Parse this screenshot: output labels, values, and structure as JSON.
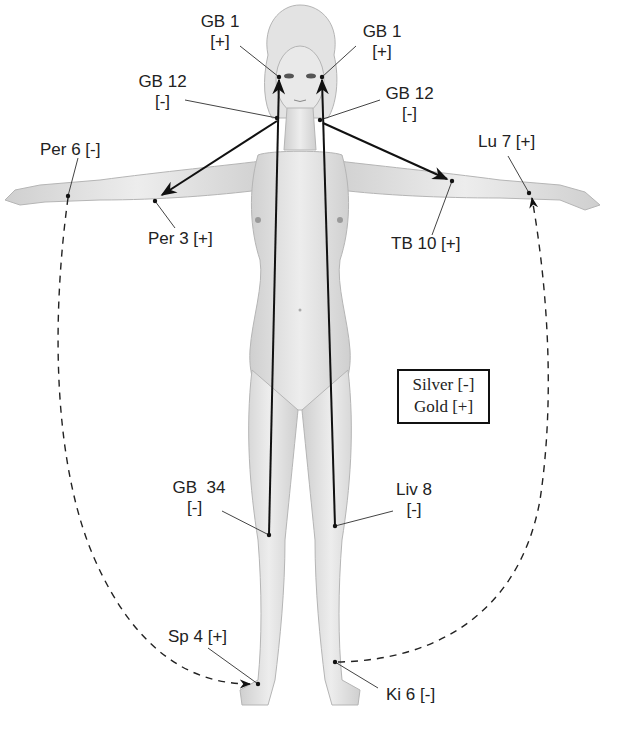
{
  "diagram": {
    "points": [
      {
        "id": "gb1-right",
        "name": "GB 1",
        "polarity": "[+]",
        "x": 279,
        "y": 77
      },
      {
        "id": "gb1-left",
        "name": "GB 1",
        "polarity": "[+]",
        "x": 322,
        "y": 77
      },
      {
        "id": "gb12-right",
        "name": "GB 12",
        "polarity": "[-]",
        "x": 277,
        "y": 118
      },
      {
        "id": "gb12-left",
        "name": "GB 12",
        "polarity": "[-]",
        "x": 320,
        "y": 120
      },
      {
        "id": "per6",
        "name": "Per 6",
        "polarity": "[-]",
        "x": 68,
        "y": 196
      },
      {
        "id": "per3",
        "name": "Per 3",
        "polarity": "[+]",
        "x": 155,
        "y": 201
      },
      {
        "id": "tb10",
        "name": "TB 10",
        "polarity": "[+]",
        "x": 452,
        "y": 181
      },
      {
        "id": "lu7",
        "name": "Lu 7",
        "polarity": "[+]",
        "x": 529,
        "y": 193
      },
      {
        "id": "gb34",
        "name": "GB 34",
        "polarity": "[-]",
        "x": 269,
        "y": 535
      },
      {
        "id": "liv8",
        "name": "Liv 8",
        "polarity": "[-]",
        "x": 335,
        "y": 526
      },
      {
        "id": "sp4",
        "name": "Sp 4",
        "polarity": "[+]",
        "x": 258,
        "y": 684
      },
      {
        "id": "ki6",
        "name": "Ki 6",
        "polarity": "[-]",
        "x": 335,
        "y": 662
      }
    ],
    "labels": {
      "gb1_right_name": "GB 1",
      "gb1_right_pol": "[+]",
      "gb1_left_name": "GB 1",
      "gb1_left_pol": "[+]",
      "gb12_right_name": "GB 12",
      "gb12_right_pol": "[-]",
      "gb12_left_name": "GB 12",
      "gb12_left_pol": "[-]",
      "per6": "Per 6 [-]",
      "per3": "Per 3 [+]",
      "lu7": "Lu 7 [+]",
      "tb10": "TB 10 [+]",
      "gb34_name": "GB  34",
      "gb34_pol": "[-]",
      "liv8_name": "Liv 8",
      "liv8_pol": "[-]",
      "sp4": "Sp 4 [+]",
      "ki6": "Ki 6 [-]"
    },
    "legend": {
      "line1": "Silver [-]",
      "line2": "Gold [+]"
    },
    "connections": [
      {
        "from": "gb34",
        "to": "gb1-right",
        "style": "solid-arrow"
      },
      {
        "from": "liv8",
        "to": "gb1-left",
        "style": "solid-arrow"
      },
      {
        "from": "gb12-right",
        "to": "per3",
        "style": "solid-arrow"
      },
      {
        "from": "gb12-left",
        "to": "tb10",
        "style": "solid-arrow"
      },
      {
        "from": "per6",
        "to": "sp4",
        "style": "dashed-arrow"
      },
      {
        "from": "ki6",
        "to": "lu7",
        "style": "dashed-arrow"
      }
    ],
    "colors": {
      "line": "#111111",
      "leader": "#444444",
      "body_fill": "#e6e6e6",
      "body_shade": "#c9c9c9",
      "text": "#222222"
    }
  }
}
